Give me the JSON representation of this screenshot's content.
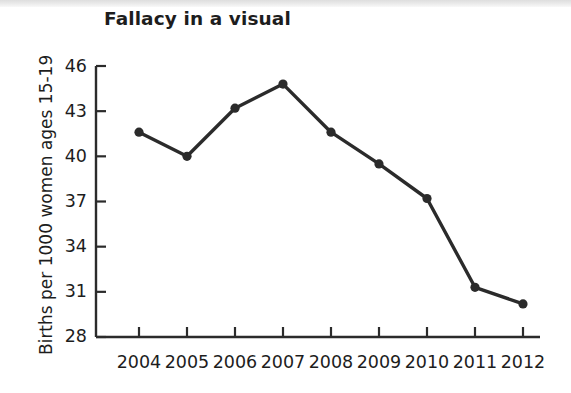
{
  "chart_data": {
    "type": "line",
    "title": "Fallacy in a visual",
    "xlabel": "",
    "ylabel": "Births per 1000 women ages 15-19",
    "categories": [
      "2004",
      "2005",
      "2006",
      "2007",
      "2008",
      "2009",
      "2010",
      "2011",
      "2012"
    ],
    "values": [
      41.6,
      40.0,
      43.2,
      44.8,
      41.6,
      39.5,
      37.2,
      31.3,
      30.2
    ],
    "series": [
      {
        "name": "Births per 1000 women ages 15-19",
        "values": [
          41.6,
          40.0,
          43.2,
          44.8,
          41.6,
          39.5,
          37.2,
          31.3,
          30.2
        ]
      }
    ],
    "ylim": [
      28,
      46
    ],
    "yticks": [
      28,
      31,
      34,
      37,
      40,
      43,
      46
    ],
    "ytick_labels": [
      "28",
      "31",
      "34",
      "37",
      "40",
      "43",
      "46"
    ],
    "xtick_labels": [
      "2004",
      "2005",
      "2006",
      "2007",
      "2008",
      "2009",
      "2010",
      "2011",
      "2012"
    ],
    "grid": false,
    "legend": false,
    "legend_position": "none",
    "marker": "circle",
    "line_color": "#2b2b2b",
    "marker_color": "#2b2b2b",
    "axis_color": "#2b2b2b",
    "text_color": "#1d1d1d",
    "background_color": "#ffffff"
  }
}
